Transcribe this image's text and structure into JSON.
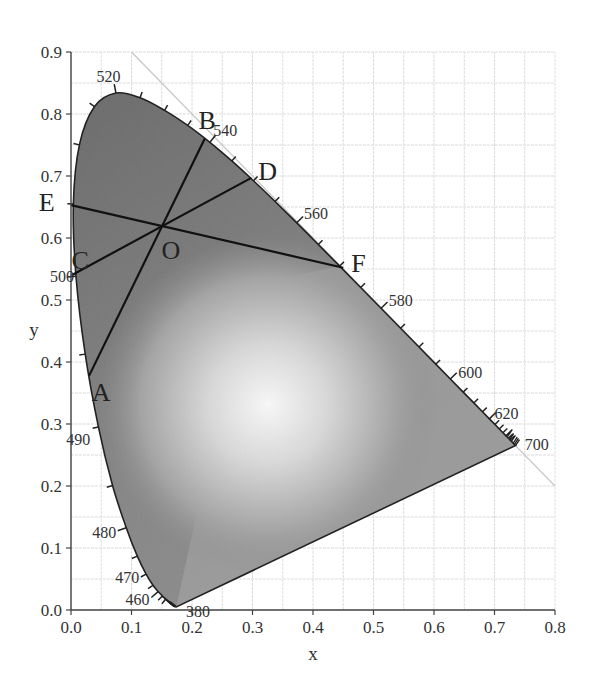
{
  "chart_data": {
    "type": "diagram",
    "xlabel": "x",
    "ylabel": "y",
    "xlim": [
      0.0,
      0.8
    ],
    "ylim": [
      0.0,
      0.9
    ],
    "grid": true,
    "grid_step_minor": 0.05,
    "x_ticks": [
      "0.0",
      "0.1",
      "0.2",
      "0.3",
      "0.4",
      "0.5",
      "0.6",
      "0.7",
      "0.8"
    ],
    "y_ticks": [
      "0.0",
      "0.1",
      "0.2",
      "0.3",
      "0.4",
      "0.5",
      "0.6",
      "0.7",
      "0.8",
      "0.9"
    ],
    "spectral_locus": [
      {
        "nm": 380,
        "x": 0.1741,
        "y": 0.005
      },
      {
        "nm": 450,
        "x": 0.1566,
        "y": 0.0177
      },
      {
        "nm": 455,
        "x": 0.151,
        "y": 0.0227
      },
      {
        "nm": 460,
        "x": 0.144,
        "y": 0.0297
      },
      {
        "nm": 465,
        "x": 0.1355,
        "y": 0.0399
      },
      {
        "nm": 470,
        "x": 0.1241,
        "y": 0.0578
      },
      {
        "nm": 475,
        "x": 0.1096,
        "y": 0.0868
      },
      {
        "nm": 480,
        "x": 0.0913,
        "y": 0.1327
      },
      {
        "nm": 485,
        "x": 0.0687,
        "y": 0.2007
      },
      {
        "nm": 490,
        "x": 0.0454,
        "y": 0.295
      },
      {
        "nm": 495,
        "x": 0.0235,
        "y": 0.4127
      },
      {
        "nm": 500,
        "x": 0.0082,
        "y": 0.5384
      },
      {
        "nm": 505,
        "x": 0.0039,
        "y": 0.6548
      },
      {
        "nm": 510,
        "x": 0.0139,
        "y": 0.7502
      },
      {
        "nm": 515,
        "x": 0.0389,
        "y": 0.812
      },
      {
        "nm": 520,
        "x": 0.0743,
        "y": 0.8338
      },
      {
        "nm": 525,
        "x": 0.1142,
        "y": 0.8262
      },
      {
        "nm": 530,
        "x": 0.1547,
        "y": 0.8059
      },
      {
        "nm": 535,
        "x": 0.1929,
        "y": 0.7816
      },
      {
        "nm": 540,
        "x": 0.2296,
        "y": 0.7543
      },
      {
        "nm": 545,
        "x": 0.2658,
        "y": 0.7243
      },
      {
        "nm": 550,
        "x": 0.3016,
        "y": 0.6923
      },
      {
        "nm": 555,
        "x": 0.3373,
        "y": 0.6589
      },
      {
        "nm": 560,
        "x": 0.3731,
        "y": 0.6245
      },
      {
        "nm": 565,
        "x": 0.4087,
        "y": 0.5896
      },
      {
        "nm": 570,
        "x": 0.4441,
        "y": 0.5547
      },
      {
        "nm": 575,
        "x": 0.4788,
        "y": 0.5202
      },
      {
        "nm": 580,
        "x": 0.5125,
        "y": 0.4866
      },
      {
        "nm": 585,
        "x": 0.5448,
        "y": 0.4544
      },
      {
        "nm": 590,
        "x": 0.5752,
        "y": 0.4242
      },
      {
        "nm": 595,
        "x": 0.6029,
        "y": 0.3965
      },
      {
        "nm": 600,
        "x": 0.627,
        "y": 0.3725
      },
      {
        "nm": 605,
        "x": 0.6482,
        "y": 0.3514
      },
      {
        "nm": 610,
        "x": 0.6658,
        "y": 0.334
      },
      {
        "nm": 615,
        "x": 0.6801,
        "y": 0.3197
      },
      {
        "nm": 620,
        "x": 0.6915,
        "y": 0.3083
      },
      {
        "nm": 625,
        "x": 0.7006,
        "y": 0.2993
      },
      {
        "nm": 630,
        "x": 0.7079,
        "y": 0.292
      },
      {
        "nm": 635,
        "x": 0.714,
        "y": 0.2859
      },
      {
        "nm": 640,
        "x": 0.719,
        "y": 0.2809
      },
      {
        "nm": 645,
        "x": 0.723,
        "y": 0.277
      },
      {
        "nm": 650,
        "x": 0.726,
        "y": 0.274
      },
      {
        "nm": 660,
        "x": 0.73,
        "y": 0.27
      },
      {
        "nm": 680,
        "x": 0.7334,
        "y": 0.2666
      },
      {
        "nm": 700,
        "x": 0.7347,
        "y": 0.2653
      }
    ],
    "wavelength_labels": [
      {
        "text": "520",
        "x": 0.062,
        "y": 0.862
      },
      {
        "text": "540",
        "x": 0.255,
        "y": 0.775
      },
      {
        "text": "560",
        "x": 0.405,
        "y": 0.64
      },
      {
        "text": "580",
        "x": 0.545,
        "y": 0.5
      },
      {
        "text": "600",
        "x": 0.66,
        "y": 0.384
      },
      {
        "text": "620",
        "x": 0.72,
        "y": 0.318
      },
      {
        "text": "700",
        "x": 0.77,
        "y": 0.268
      },
      {
        "text": "500",
        "x": -0.015,
        "y": 0.538
      },
      {
        "text": "490",
        "x": 0.012,
        "y": 0.276
      },
      {
        "text": "480",
        "x": 0.055,
        "y": 0.126
      },
      {
        "text": "470",
        "x": 0.093,
        "y": 0.054
      },
      {
        "text": "460",
        "x": 0.11,
        "y": 0.018
      },
      {
        "text": "380",
        "x": 0.21,
        "y": -0.002
      }
    ],
    "reference_line": {
      "label": "x + y = 1",
      "from": [
        0.1,
        0.9
      ],
      "to": [
        0.8,
        0.2
      ],
      "color": "#c8c8c8"
    },
    "center_point": {
      "label": "O",
      "x": 0.145,
      "y": 0.613
    },
    "lines": [
      {
        "from": "A",
        "to": "B",
        "a": [
          0.03,
          0.378
        ],
        "b": [
          0.221,
          0.76
        ]
      },
      {
        "from": "C",
        "to": "D",
        "a": [
          0.001,
          0.54
        ],
        "b": [
          0.298,
          0.697
        ]
      },
      {
        "from": "E",
        "to": "F",
        "a": [
          0.0,
          0.653
        ],
        "b": [
          0.45,
          0.552
        ]
      }
    ],
    "point_labels": [
      {
        "text": "B",
        "x": 0.225,
        "y": 0.79
      },
      {
        "text": "D",
        "x": 0.325,
        "y": 0.708
      },
      {
        "text": "E",
        "x": -0.04,
        "y": 0.658
      },
      {
        "text": "C",
        "x": 0.015,
        "y": 0.565
      },
      {
        "text": "O",
        "x": 0.165,
        "y": 0.58
      },
      {
        "text": "F",
        "x": 0.475,
        "y": 0.56
      },
      {
        "text": "A",
        "x": 0.05,
        "y": 0.352
      }
    ],
    "fill_colors": {
      "dark": "#6e6e6e",
      "mid": "#9a9a9a",
      "light": "#f4f4f4"
    },
    "white_point": {
      "x": 0.32,
      "y": 0.33
    }
  }
}
